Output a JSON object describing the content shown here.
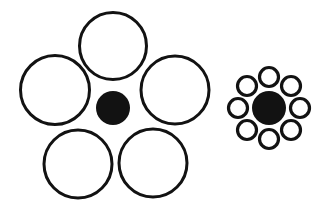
{
  "figure": {
    "name": "Ebbinghaus illusion (Titchener circles)",
    "background_color": "#ffffff",
    "stroke_color": "#121212",
    "fill_color": "#121212",
    "width": 329,
    "height": 212
  },
  "chart_data": {
    "type": "diagram",
    "groups": [
      {
        "id": "left-group",
        "label": "Target surrounded by large inducers",
        "target": {
          "id": "left-target",
          "label": "Left central black disc",
          "cx": 113,
          "cy": 108,
          "r": 17,
          "fill": "#121212",
          "stroke": "none",
          "stroke_width": 0
        },
        "inducer_count": 5,
        "inducer_mean_radius": 34,
        "inducers": [
          {
            "id": "left-inducer-top",
            "label": "Top large circle",
            "cx": 113,
            "cy": 46,
            "r": 33.5,
            "stroke": "#121212",
            "stroke_width": 3,
            "fill": "none"
          },
          {
            "id": "left-inducer-left",
            "label": "Left large circle",
            "cx": 55,
            "cy": 90,
            "r": 34.5,
            "stroke": "#121212",
            "stroke_width": 3,
            "fill": "none"
          },
          {
            "id": "left-inducer-right",
            "label": "Right large circle",
            "cx": 175,
            "cy": 90,
            "r": 34.0,
            "stroke": "#121212",
            "stroke_width": 3,
            "fill": "none"
          },
          {
            "id": "left-inducer-bottom-left",
            "label": "Bottom-left large circle",
            "cx": 78,
            "cy": 164,
            "r": 34.0,
            "stroke": "#121212",
            "stroke_width": 3,
            "fill": "none"
          },
          {
            "id": "left-inducer-bottom-right",
            "label": "Bottom-right large circle",
            "cx": 153,
            "cy": 163,
            "r": 34.0,
            "stroke": "#121212",
            "stroke_width": 3,
            "fill": "none"
          }
        ]
      },
      {
        "id": "right-group",
        "label": "Target surrounded by small inducers",
        "target": {
          "id": "right-target",
          "label": "Right central black disc",
          "cx": 269,
          "cy": 108,
          "r": 17,
          "fill": "#121212",
          "stroke": "none",
          "stroke_width": 0
        },
        "inducer_count": 8,
        "inducer_mean_radius": 9.5,
        "inducer_orbit_radius": 31,
        "inducers": [
          {
            "id": "right-inducer-n",
            "label": "North small circle",
            "cx": 269,
            "cy": 77,
            "r": 9.5,
            "stroke": "#121212",
            "stroke_width": 3.2,
            "fill": "none"
          },
          {
            "id": "right-inducer-ne",
            "label": "North-east small circle",
            "cx": 291,
            "cy": 86,
            "r": 9.5,
            "stroke": "#121212",
            "stroke_width": 3.2,
            "fill": "none"
          },
          {
            "id": "right-inducer-e",
            "label": "East small circle",
            "cx": 300,
            "cy": 108,
            "r": 9.5,
            "stroke": "#121212",
            "stroke_width": 3.2,
            "fill": "none"
          },
          {
            "id": "right-inducer-se",
            "label": "South-east small circle",
            "cx": 291,
            "cy": 130,
            "r": 9.5,
            "stroke": "#121212",
            "stroke_width": 3.2,
            "fill": "none"
          },
          {
            "id": "right-inducer-s",
            "label": "South small circle",
            "cx": 269,
            "cy": 139,
            "r": 9.5,
            "stroke": "#121212",
            "stroke_width": 3.2,
            "fill": "none"
          },
          {
            "id": "right-inducer-sw",
            "label": "South-west small circle",
            "cx": 247,
            "cy": 130,
            "r": 9.5,
            "stroke": "#121212",
            "stroke_width": 3.2,
            "fill": "none"
          },
          {
            "id": "right-inducer-w",
            "label": "West small circle",
            "cx": 238,
            "cy": 108,
            "r": 9.5,
            "stroke": "#121212",
            "stroke_width": 3.2,
            "fill": "none"
          },
          {
            "id": "right-inducer-nw",
            "label": "North-west small circle",
            "cx": 247,
            "cy": 86,
            "r": 9.5,
            "stroke": "#121212",
            "stroke_width": 3.2,
            "fill": "none"
          }
        ]
      }
    ]
  }
}
